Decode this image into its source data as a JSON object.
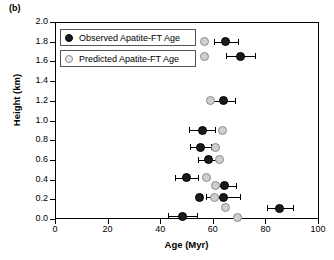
{
  "panel": {
    "label": "(b)"
  },
  "legend": {
    "position": "top-left-inside",
    "entries": [
      {
        "key": "observed",
        "label": "Observed Apatite-FT Age",
        "marker": "filled-circle",
        "color": "#1a1a1a"
      },
      {
        "key": "predicted",
        "label": "Predicted Apatite-FT Age",
        "marker": "open-circle",
        "color": "#cfcfcf"
      }
    ]
  },
  "chart_data": {
    "type": "scatter",
    "title": "",
    "xlabel": "Age (Myr)",
    "ylabel": "Height (km)",
    "xlim": [
      0,
      100
    ],
    "ylim": [
      0.0,
      2.0
    ],
    "xticks": [
      0,
      20,
      40,
      60,
      80,
      100
    ],
    "xticklabels": [
      "0",
      "20",
      "40",
      "60",
      "80",
      "100"
    ],
    "yticks": [
      0.0,
      0.2,
      0.4,
      0.6,
      0.8,
      1.0,
      1.2,
      1.4,
      1.6,
      1.8,
      2.0
    ],
    "yticklabels": [
      "0.0",
      "0.2",
      "0.4",
      "0.6",
      "0.8",
      "1.0",
      "1.2",
      "1.4",
      "1.6",
      "1.8",
      "2.0"
    ],
    "grid": false,
    "orientation": "x = age, y = height",
    "series": [
      {
        "name": "Observed Apatite-FT Age",
        "marker": "filled-circle",
        "color": "#1a1a1a",
        "error_bars": "x",
        "points": [
          {
            "x": 65.0,
            "y": 1.8,
            "xerr": 4.5
          },
          {
            "x": 70.5,
            "y": 1.65,
            "xerr": 5.5
          },
          {
            "x": 64.0,
            "y": 1.2,
            "xerr": 4.5
          },
          {
            "x": 56.0,
            "y": 0.9,
            "xerr": 5.0
          },
          {
            "x": 55.5,
            "y": 0.73,
            "xerr": 4.0
          },
          {
            "x": 58.5,
            "y": 0.6,
            "xerr": 4.0
          },
          {
            "x": 50.0,
            "y": 0.42,
            "xerr": 4.5
          },
          {
            "x": 64.5,
            "y": 0.34,
            "xerr": 4.5
          },
          {
            "x": 55.0,
            "y": 0.22,
            "xerr": 0.0
          },
          {
            "x": 64.0,
            "y": 0.22,
            "xerr": 6.5
          },
          {
            "x": 48.5,
            "y": 0.03,
            "xerr": 5.5
          },
          {
            "x": 85.5,
            "y": 0.11,
            "xerr": 5.0
          }
        ]
      },
      {
        "name": "Predicted Apatite-FT Age",
        "marker": "open-circle",
        "color": "#cfcfcf",
        "error_bars": "none",
        "points": [
          {
            "x": 57.0,
            "y": 1.8
          },
          {
            "x": 57.0,
            "y": 1.65
          },
          {
            "x": 59.0,
            "y": 1.2
          },
          {
            "x": 63.5,
            "y": 0.9
          },
          {
            "x": 61.0,
            "y": 0.73
          },
          {
            "x": 62.5,
            "y": 0.6
          },
          {
            "x": 57.5,
            "y": 0.42
          },
          {
            "x": 61.0,
            "y": 0.34
          },
          {
            "x": 60.5,
            "y": 0.22
          },
          {
            "x": 65.0,
            "y": 0.12
          },
          {
            "x": 69.5,
            "y": 0.02
          }
        ]
      }
    ]
  }
}
